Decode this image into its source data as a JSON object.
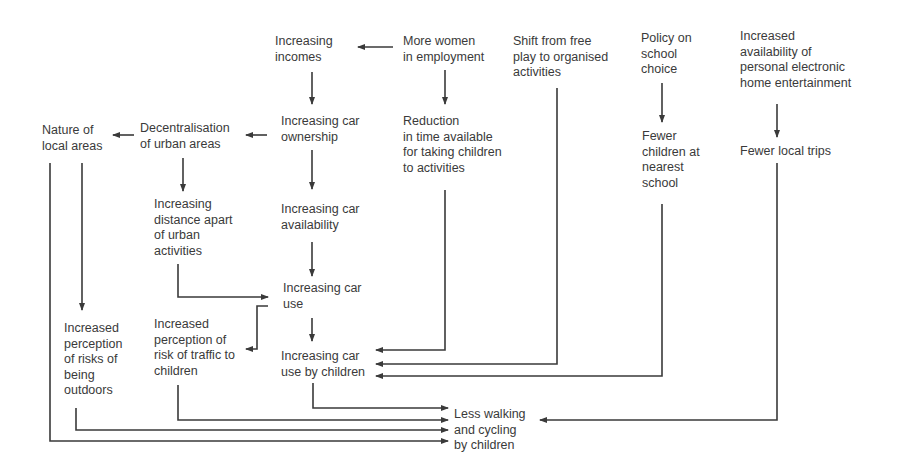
{
  "diagram": {
    "type": "causal-flow",
    "nodes": {
      "increasing_incomes": "Increasing\nincomes",
      "more_women": "More women\nin employment",
      "shift_free_play": "Shift from free\nplay to organised\nactivities",
      "policy_school": "Policy on\nschool\nchoice",
      "electronic_entertainment": "Increased\navailability of\npersonal electronic\nhome entertainment",
      "nature_local": "Nature of\nlocal areas",
      "decentralisation": "Decentralisation\nof urban areas",
      "car_ownership": "Increasing car\nownership",
      "reduction_time": "Reduction\nin time available\nfor taking children\nto activities",
      "fewer_children_school": "Fewer\nchildren at\nnearest\nschool",
      "fewer_local_trips": "Fewer local trips",
      "distance_apart": "Increasing\ndistance apart\nof urban\nactivities",
      "car_availability": "Increasing car\navailability",
      "car_use": "Increasing car\nuse",
      "risks_outdoors": "Increased\nperception\nof risks of\nbeing\noutdoors",
      "risk_traffic": "Increased\nperception of\nrisk of traffic to\nchildren",
      "car_use_children": "Increasing car\nuse by children",
      "less_walking": "Less walking\nand cycling\nby children"
    },
    "edges": [
      [
        "more_women",
        "increasing_incomes"
      ],
      [
        "more_women",
        "reduction_time"
      ],
      [
        "increasing_incomes",
        "car_ownership"
      ],
      [
        "car_ownership",
        "decentralisation"
      ],
      [
        "decentralisation",
        "nature_local"
      ],
      [
        "car_ownership",
        "car_availability"
      ],
      [
        "decentralisation",
        "distance_apart"
      ],
      [
        "distance_apart",
        "car_use"
      ],
      [
        "car_availability",
        "car_use"
      ],
      [
        "car_use",
        "risk_traffic"
      ],
      [
        "car_use",
        "car_use_children"
      ],
      [
        "reduction_time",
        "car_use_children"
      ],
      [
        "shift_free_play",
        "car_use_children"
      ],
      [
        "policy_school",
        "fewer_children_school"
      ],
      [
        "fewer_children_school",
        "car_use_children"
      ],
      [
        "electronic_entertainment",
        "fewer_local_trips"
      ],
      [
        "fewer_local_trips",
        "less_walking"
      ],
      [
        "nature_local",
        "risks_outdoors"
      ],
      [
        "car_use_children",
        "less_walking"
      ],
      [
        "risk_traffic",
        "less_walking"
      ],
      [
        "risks_outdoors",
        "less_walking"
      ],
      [
        "nature_local",
        "less_walking"
      ]
    ]
  }
}
